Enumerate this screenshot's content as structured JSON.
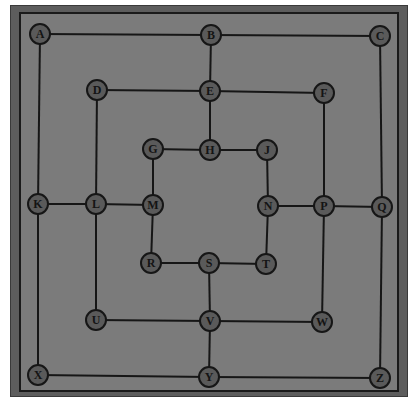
{
  "game": {
    "title": "Nine Men's Morris board",
    "colors": {
      "outer_frame": "#5d5d5d",
      "board": "#7b7b7b",
      "lines": "#161616",
      "node_fill": "#5a5a5a"
    }
  },
  "nodes": [
    {
      "id": "A",
      "label": "A",
      "x": 40,
      "y": 34
    },
    {
      "id": "B",
      "label": "B",
      "x": 211,
      "y": 35
    },
    {
      "id": "C",
      "label": "C",
      "x": 380,
      "y": 36
    },
    {
      "id": "D",
      "label": "D",
      "x": 97,
      "y": 90
    },
    {
      "id": "E",
      "label": "E",
      "x": 210,
      "y": 91
    },
    {
      "id": "F",
      "label": "F",
      "x": 324,
      "y": 93
    },
    {
      "id": "G",
      "label": "G",
      "x": 153,
      "y": 149
    },
    {
      "id": "H",
      "label": "H",
      "x": 210,
      "y": 150
    },
    {
      "id": "J",
      "label": "J",
      "x": 267,
      "y": 150
    },
    {
      "id": "K",
      "label": "K",
      "x": 38,
      "y": 204
    },
    {
      "id": "L",
      "label": "L",
      "x": 96,
      "y": 204
    },
    {
      "id": "M",
      "label": "M",
      "x": 153,
      "y": 205
    },
    {
      "id": "N",
      "label": "N",
      "x": 268,
      "y": 206
    },
    {
      "id": "P",
      "label": "P",
      "x": 324,
      "y": 206
    },
    {
      "id": "Q",
      "label": "Q",
      "x": 382,
      "y": 207
    },
    {
      "id": "R",
      "label": "R",
      "x": 151,
      "y": 263
    },
    {
      "id": "S",
      "label": "S",
      "x": 209,
      "y": 263
    },
    {
      "id": "T",
      "label": "T",
      "x": 266,
      "y": 264
    },
    {
      "id": "U",
      "label": "U",
      "x": 96,
      "y": 320
    },
    {
      "id": "V",
      "label": "V",
      "x": 210,
      "y": 321
    },
    {
      "id": "W",
      "label": "W",
      "x": 322,
      "y": 322
    },
    {
      "id": "X",
      "label": "X",
      "x": 38,
      "y": 375
    },
    {
      "id": "Y",
      "label": "Y",
      "x": 209,
      "y": 377
    },
    {
      "id": "Z",
      "label": "Z",
      "x": 380,
      "y": 378
    }
  ],
  "edges": [
    [
      "A",
      "B"
    ],
    [
      "B",
      "C"
    ],
    [
      "A",
      "K"
    ],
    [
      "K",
      "X"
    ],
    [
      "C",
      "Q"
    ],
    [
      "Q",
      "Z"
    ],
    [
      "X",
      "Y"
    ],
    [
      "Y",
      "Z"
    ],
    [
      "D",
      "E"
    ],
    [
      "E",
      "F"
    ],
    [
      "D",
      "L"
    ],
    [
      "L",
      "U"
    ],
    [
      "F",
      "P"
    ],
    [
      "P",
      "W"
    ],
    [
      "U",
      "V"
    ],
    [
      "V",
      "W"
    ],
    [
      "G",
      "H"
    ],
    [
      "H",
      "J"
    ],
    [
      "G",
      "M"
    ],
    [
      "M",
      "R"
    ],
    [
      "J",
      "N"
    ],
    [
      "N",
      "T"
    ],
    [
      "R",
      "S"
    ],
    [
      "S",
      "T"
    ],
    [
      "B",
      "E"
    ],
    [
      "E",
      "H"
    ],
    [
      "K",
      "L"
    ],
    [
      "L",
      "M"
    ],
    [
      "N",
      "P"
    ],
    [
      "P",
      "Q"
    ],
    [
      "S",
      "V"
    ],
    [
      "V",
      "Y"
    ]
  ]
}
